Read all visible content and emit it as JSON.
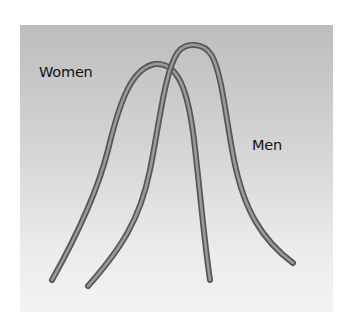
{
  "diagram": {
    "type": "overlapping-distribution-curves",
    "labels": {
      "women": "Women",
      "men": "Men"
    },
    "curves": [
      {
        "name": "Women",
        "peak": [
          155,
          63
        ],
        "left_end": [
          52,
          280
        ],
        "right_end": [
          210,
          280
        ]
      },
      {
        "name": "Men",
        "peak": [
          193,
          45
        ],
        "left_end": [
          88,
          286
        ],
        "right_end": [
          293,
          263
        ]
      }
    ],
    "colors": {
      "panel_top": "#bdbdbd",
      "panel_bottom": "#f3f3f3",
      "curve_outline": "#555555",
      "curve_core": "#9a9a9a",
      "text": "#111111"
    }
  }
}
